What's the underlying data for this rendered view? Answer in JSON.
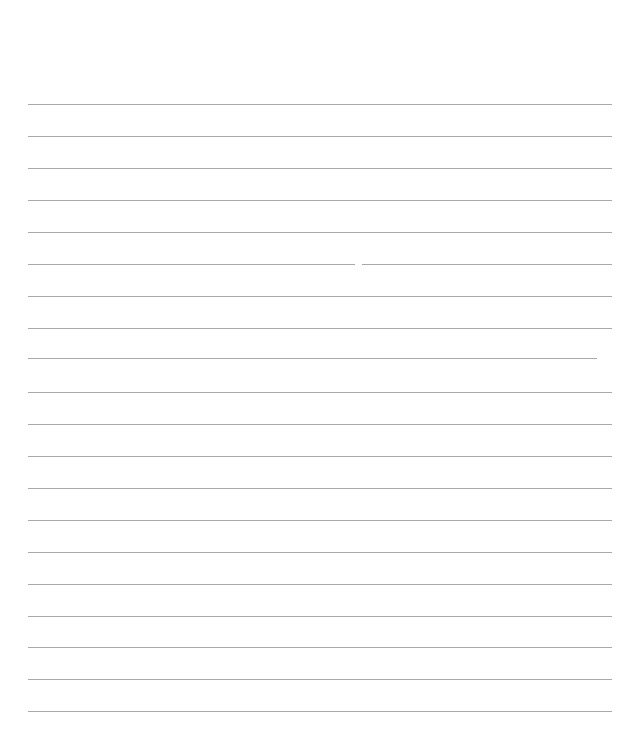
{
  "document": {
    "type": "lined-paper",
    "background_color": "#ffffff",
    "rule_color": "#9a9a9a",
    "rule_count": 20,
    "rules": [
      {
        "y": 104,
        "x_start": 28,
        "x_end": 612
      },
      {
        "y": 136,
        "x_start": 28,
        "x_end": 612
      },
      {
        "y": 168,
        "x_start": 28,
        "x_end": 612
      },
      {
        "y": 200,
        "x_start": 28,
        "x_end": 612
      },
      {
        "y": 232,
        "x_start": 28,
        "x_end": 612
      },
      {
        "y": 264,
        "x_start": 28,
        "x_end": 612,
        "gap_x": 355
      },
      {
        "y": 296,
        "x_start": 28,
        "x_end": 612
      },
      {
        "y": 328,
        "x_start": 28,
        "x_end": 612
      },
      {
        "y": 358,
        "x_start": 28,
        "x_end": 597
      },
      {
        "y": 392,
        "x_start": 28,
        "x_end": 612
      },
      {
        "y": 424,
        "x_start": 28,
        "x_end": 612
      },
      {
        "y": 456,
        "x_start": 28,
        "x_end": 612
      },
      {
        "y": 488,
        "x_start": 28,
        "x_end": 612
      },
      {
        "y": 520,
        "x_start": 28,
        "x_end": 612
      },
      {
        "y": 552,
        "x_start": 28,
        "x_end": 612
      },
      {
        "y": 584,
        "x_start": 28,
        "x_end": 612
      },
      {
        "y": 616,
        "x_start": 28,
        "x_end": 612
      },
      {
        "y": 647,
        "x_start": 28,
        "x_end": 612
      },
      {
        "y": 679,
        "x_start": 28,
        "x_end": 612
      },
      {
        "y": 711,
        "x_start": 28,
        "x_end": 612
      }
    ]
  }
}
